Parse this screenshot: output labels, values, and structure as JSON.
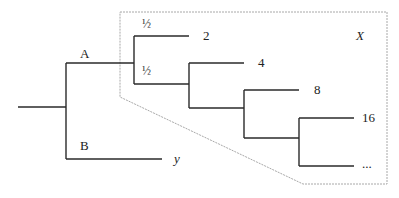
{
  "diagram": {
    "type": "tree",
    "colors": {
      "edge": "#2a2a2a",
      "box": "#a0a0a0",
      "text": "#222222"
    },
    "branch_labels": {
      "A": "A",
      "B": "B"
    },
    "probabilities": {
      "upper": "½",
      "lower": "½"
    },
    "leaves": {
      "y": "y",
      "two": "2",
      "four": "4",
      "eight": "8",
      "sixteen": "16",
      "ellipsis": "..."
    },
    "region_label": "X"
  }
}
